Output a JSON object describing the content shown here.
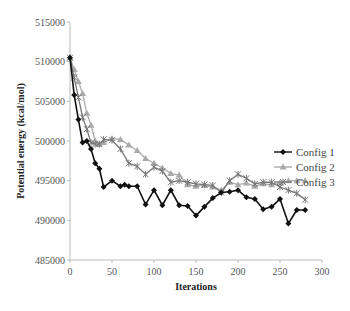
{
  "chart_data": {
    "type": "line",
    "title": "",
    "xlabel": "Iterations",
    "ylabel": "Potential energy (kcal/mol)",
    "xlim": [
      0,
      300
    ],
    "ylim": [
      485000,
      515000
    ],
    "x_ticks": [
      "0",
      "50",
      "100",
      "150",
      "200",
      "250",
      "300"
    ],
    "y_ticks": [
      "485000",
      "490000",
      "495000",
      "500000",
      "505000",
      "510000",
      "515000"
    ],
    "grid": false,
    "legend_position": "right",
    "series": [
      {
        "name": "Config 1",
        "color": "#111111",
        "marker": "diamond",
        "x": [
          0,
          5,
          10,
          15,
          20,
          25,
          30,
          35,
          40,
          50,
          60,
          65,
          70,
          80,
          90,
          100,
          110,
          120,
          130,
          140,
          150,
          160,
          170,
          180,
          190,
          200,
          210,
          220,
          230,
          240,
          250,
          260,
          270,
          280
        ],
        "y": [
          510500,
          505800,
          502700,
          499800,
          500000,
          499000,
          497200,
          496500,
          494200,
          495000,
          494300,
          494500,
          494300,
          494300,
          492000,
          493800,
          491900,
          493800,
          491900,
          491800,
          490600,
          491700,
          492800,
          493500,
          493600,
          493800,
          492900,
          492700,
          491400,
          491700,
          492700,
          489600,
          491300,
          491300
        ]
      },
      {
        "name": "Config 2",
        "color": "#aaaaaa",
        "marker": "triangle",
        "x": [
          0,
          5,
          10,
          15,
          20,
          25,
          30,
          35,
          40,
          50,
          60,
          70,
          80,
          90,
          100,
          110,
          120,
          130,
          140,
          150,
          160,
          170,
          180,
          190,
          200,
          210,
          220,
          230,
          240,
          250,
          260,
          270,
          280
        ],
        "y": [
          510500,
          509000,
          507500,
          506000,
          503500,
          502000,
          500000,
          499600,
          499800,
          500300,
          500200,
          499500,
          498800,
          497800,
          497200,
          496600,
          495900,
          495700,
          494500,
          494300,
          494400,
          494200,
          493800,
          494800,
          494500,
          494700,
          494300,
          494600,
          494500,
          494700,
          495000,
          495000,
          495000
        ]
      },
      {
        "name": "Config 3",
        "color": "#777777",
        "marker": "x",
        "x": [
          0,
          5,
          10,
          15,
          20,
          25,
          30,
          35,
          40,
          50,
          60,
          70,
          80,
          90,
          100,
          110,
          120,
          130,
          140,
          150,
          160,
          170,
          180,
          190,
          200,
          210,
          220,
          230,
          240,
          250,
          260,
          270,
          280
        ],
        "y": [
          510500,
          508000,
          505500,
          503000,
          501500,
          499800,
          499600,
          499600,
          500200,
          500100,
          499000,
          497200,
          496800,
          495800,
          496700,
          496200,
          494800,
          495000,
          494800,
          494600,
          494500,
          494400,
          493500,
          495000,
          495800,
          495300,
          494600,
          494800,
          494800,
          494200,
          493800,
          493400,
          492600
        ]
      }
    ]
  }
}
